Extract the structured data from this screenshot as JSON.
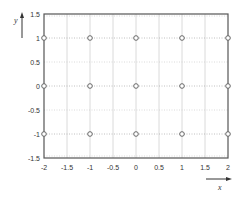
{
  "chart_data": {
    "type": "scatter",
    "title": "",
    "xlabel": "x",
    "ylabel": "y",
    "xlim": [
      -2,
      2
    ],
    "ylim": [
      -1.5,
      1.5
    ],
    "xticks": [
      -2,
      -1.5,
      -1,
      -0.5,
      0,
      0.5,
      1,
      1.5,
      2
    ],
    "xtick_labels": [
      "-2",
      "-1.5",
      "-1",
      "-0.5",
      "0",
      "0.5",
      "1",
      "1.5",
      "2"
    ],
    "yticks": [
      1.5,
      1,
      0.5,
      0,
      -0.5,
      -1,
      -1.5
    ],
    "ytick_labels": [
      "1.5",
      "1",
      "0.5",
      "0",
      "-0.5",
      "-1",
      "-1.5"
    ],
    "grid": true,
    "legend": null,
    "marker": "open-circle",
    "series": [
      {
        "name": "grid points",
        "points": [
          {
            "x": -2,
            "y": 1
          },
          {
            "x": -1,
            "y": 1
          },
          {
            "x": 0,
            "y": 1
          },
          {
            "x": 1,
            "y": 1
          },
          {
            "x": 2,
            "y": 1
          },
          {
            "x": -2,
            "y": 0
          },
          {
            "x": -1,
            "y": 0
          },
          {
            "x": 0,
            "y": 0
          },
          {
            "x": 1,
            "y": 0
          },
          {
            "x": 2,
            "y": 0
          },
          {
            "x": -2,
            "y": -1
          },
          {
            "x": -1,
            "y": -1
          },
          {
            "x": 0,
            "y": -1
          },
          {
            "x": 1,
            "y": -1
          },
          {
            "x": 2,
            "y": -1
          }
        ]
      }
    ]
  },
  "colors": {
    "frame": "#555555",
    "grid_major": "#b0b0b0",
    "grid_minor": "#d0d0d0",
    "marker_stroke": "#666666",
    "marker_fill": "#ffffff",
    "text": "#333333"
  }
}
